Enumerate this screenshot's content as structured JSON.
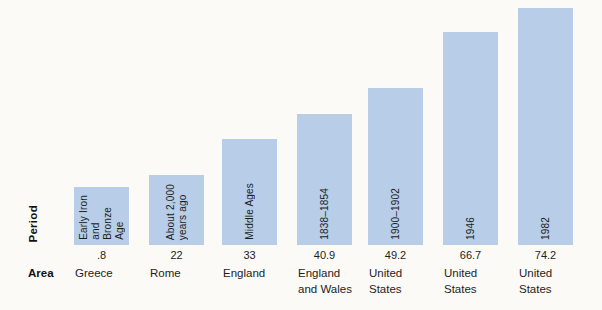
{
  "chart_data": {
    "type": "bar",
    "title": "",
    "categories": [
      "Greece",
      "Rome",
      "England",
      "England and Wales",
      "United States",
      "United States",
      "United States"
    ],
    "period_annotations": [
      "Early Iron and Bronze Age",
      "About 2,000 years ago",
      "Middle Ages",
      "1838–1854",
      "1900–1902",
      "1946",
      "1982"
    ],
    "values": [
      18,
      22,
      33,
      40.9,
      49.2,
      66.7,
      74.2
    ],
    "value_labels": [
      ".8",
      "22",
      "33",
      "40.9",
      "49.2",
      "66.7",
      "74.2"
    ],
    "xlabel": "Area",
    "ylabel": "",
    "row_headers": {
      "period": "Period",
      "area": "Area"
    },
    "ylim": [
      0,
      76
    ],
    "grid": false,
    "legend": false,
    "axis_lines": false,
    "bar_color": "#b7cde8"
  },
  "labels": {
    "period": "Period",
    "area": "Area"
  },
  "bars": [
    {
      "period_lines": "Early Iron\nand\nBronze\nAge",
      "value": 18,
      "value_label": ".8",
      "area_lines": "Greece"
    },
    {
      "period_lines": "About 2,000\nyears ago",
      "value": 22,
      "value_label": "22",
      "area_lines": "Rome"
    },
    {
      "period_lines": "Middle Ages",
      "value": 33,
      "value_label": "33",
      "area_lines": "England"
    },
    {
      "period_lines": "1838–1854",
      "value": 40.9,
      "value_label": "40.9",
      "area_lines": "England\nand Wales"
    },
    {
      "period_lines": "1900–1902",
      "value": 49.2,
      "value_label": "49.2",
      "area_lines": "United\nStates"
    },
    {
      "period_lines": "1946",
      "value": 66.7,
      "value_label": "66.7",
      "area_lines": "United\nStates"
    },
    {
      "period_lines": "1982",
      "value": 74.2,
      "value_label": "74.2",
      "area_lines": "United\nStates"
    }
  ],
  "colors": {
    "bar_fill": "#b7cde8",
    "text": "#1e1e1e",
    "background": "#fbfaf6"
  }
}
